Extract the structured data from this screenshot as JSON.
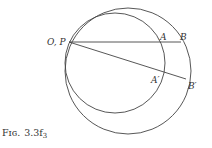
{
  "figure": {
    "caption": "Fig. 3.3f3",
    "caption_parts": {
      "prefix": "Fɪɢ.",
      "number": "3.3f",
      "subscript": "3"
    },
    "labels": {
      "OP": "O, P",
      "A": "A",
      "B": "B",
      "A_prime": "A′",
      "B_prime": "B′"
    },
    "elements": {
      "circles": [
        {
          "name": "large-circle",
          "cx": 128,
          "cy": 71,
          "r": 63
        },
        {
          "name": "small-circle",
          "cx": 115,
          "cy": 63,
          "r": 50
        }
      ],
      "lines": [
        {
          "name": "line-PB",
          "from": "P",
          "to": "B"
        },
        {
          "name": "line-PB-prime",
          "from": "P",
          "to": "B′"
        }
      ],
      "points": {
        "P": [
          69,
          42
        ],
        "A": [
          162,
          42
        ],
        "B": [
          181,
          42
        ],
        "A_prime": [
          164,
          71
        ],
        "B_prime": [
          186,
          79
        ]
      }
    },
    "colors": {
      "stroke": "#444444",
      "text": "#333333",
      "background": "#ffffff"
    }
  }
}
